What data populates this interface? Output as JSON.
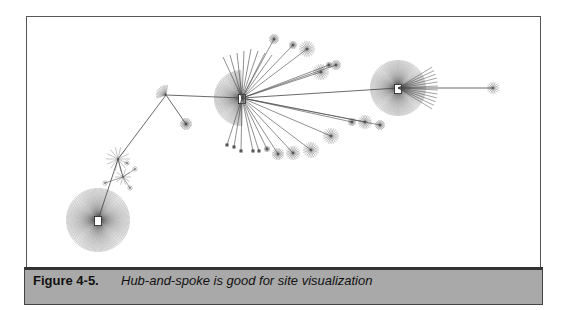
{
  "figure": {
    "label": "Figure 4-5.",
    "title": "Hub-and-spoke is good for site visualization"
  },
  "colors": {
    "frame_border": "#555555",
    "caption_bg": "#a9a9a9",
    "caption_border": "#333333",
    "edge": "#444444",
    "node": "#222222"
  },
  "graph": {
    "hubs": [
      {
        "id": "hub-left-bottom",
        "cx": 71,
        "cy": 203,
        "r": 32,
        "spokes": 140
      },
      {
        "id": "hub-center",
        "cx": 215,
        "cy": 81,
        "r": 28,
        "spokes": 90,
        "half": "left"
      },
      {
        "id": "hub-right",
        "cx": 371,
        "cy": 71,
        "r": 28,
        "spokes": 120
      },
      {
        "id": "hub-small-left",
        "cx": 139,
        "cy": 78,
        "r": 10,
        "spokes": 14
      }
    ],
    "edges": [
      [
        71,
        203,
        91,
        142
      ],
      [
        91,
        142,
        139,
        78
      ],
      [
        139,
        78,
        215,
        81
      ],
      [
        139,
        78,
        159,
        107
      ],
      [
        215,
        81,
        371,
        71
      ],
      [
        371,
        71,
        466,
        71
      ]
    ]
  }
}
